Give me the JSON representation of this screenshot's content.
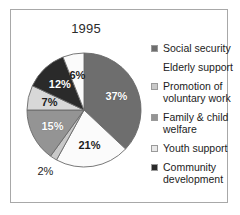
{
  "frame": {
    "border_color": "#a8a8a8",
    "background": "#ffffff"
  },
  "chart_data": {
    "type": "pie",
    "title": "1995",
    "xlabel": "",
    "ylabel": "",
    "legend_position": "right",
    "grid": false,
    "categories": [
      "Social security",
      "Elderly support",
      "Promotion of voluntary work",
      "Family & child welfare",
      "Youth support",
      "Community development"
    ],
    "values": [
      37,
      21,
      2,
      15,
      7,
      12
    ],
    "value_labels": [
      "37%",
      "21%",
      "2%",
      "15%",
      "7%",
      "12%",
      "6%"
    ],
    "slices": [
      {
        "label": "Social security",
        "value": 37,
        "value_label": "37%",
        "color": "#6e6e6e",
        "label_placement": "inside"
      },
      {
        "label": "Elderly support",
        "value": 21,
        "value_label": "21%",
        "color": "#fbfbfb",
        "label_placement": "inside"
      },
      {
        "label": "Promotion of voluntary work",
        "value": 2,
        "value_label": "2%",
        "color": "#c9c9c9",
        "label_placement": "outside"
      },
      {
        "label": "Family & child welfare",
        "value": 15,
        "value_label": "15%",
        "color": "#949494",
        "label_placement": "inside"
      },
      {
        "label": "Youth support",
        "value": 7,
        "value_label": "7%",
        "color": "#d8d8d8",
        "label_placement": "inside"
      },
      {
        "label": "Community development",
        "value": 12,
        "value_label": "12%",
        "color": "#2a2a2a",
        "label_placement": "inside"
      },
      {
        "label": "",
        "value": 6,
        "value_label": "6%",
        "color": "#fbfbfb",
        "label_placement": "inside"
      }
    ]
  },
  "legend": {
    "items": [
      {
        "label": "Social security",
        "color": "#6e6e6e",
        "has_swatch": true
      },
      {
        "label": "Elderly support",
        "color": "#ffffff",
        "has_swatch": false
      },
      {
        "label": "Promotion of voluntary work",
        "color": "#c9c9c9",
        "has_swatch": true
      },
      {
        "label": "Family & child welfare",
        "color": "#949494",
        "has_swatch": true
      },
      {
        "label": "Youth support",
        "color": "#e8e8e8",
        "has_swatch": true
      },
      {
        "label": "Community development",
        "color": "#2a2a2a",
        "has_swatch": true
      }
    ]
  }
}
